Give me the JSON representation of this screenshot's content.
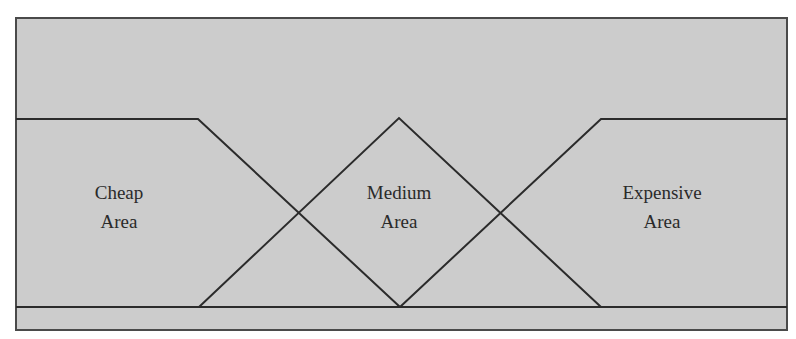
{
  "diagram": {
    "type": "fuzzy-membership-regions",
    "colors": {
      "background": "#ffffff",
      "fill": "#cccccc",
      "line": "#2b2b2b",
      "border": "#4a4a4a",
      "text": "#2a2a2a"
    },
    "regions": [
      {
        "id": "cheap",
        "line1": "Cheap",
        "line2": "Area"
      },
      {
        "id": "medium",
        "line1": "Medium",
        "line2": "Area"
      },
      {
        "id": "expensive",
        "line1": "Expensive",
        "line2": "Area"
      }
    ]
  }
}
